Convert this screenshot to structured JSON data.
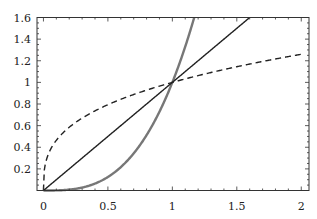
{
  "chart_data": {
    "type": "line",
    "title": "",
    "xlabel": "",
    "ylabel": "",
    "xlim": [
      -0.05,
      2.06
    ],
    "ylim": [
      0,
      1.6
    ],
    "grid": false,
    "legend": null,
    "x_ticks": [
      0,
      0.5,
      1,
      1.5,
      2
    ],
    "x_tick_labels": [
      "0",
      "0.5",
      "1",
      "1.5",
      "2"
    ],
    "y_ticks": [
      0.2,
      0.4,
      0.6,
      0.8,
      1,
      1.2,
      1.4,
      1.6
    ],
    "y_tick_labels": [
      "0.2",
      "0.4",
      "0.6",
      "0.8",
      "1",
      "1.2",
      "1.4",
      "1.6"
    ],
    "series": [
      {
        "name": "y = x^3",
        "style": "solid-thick",
        "color": "#777777",
        "x": [
          0,
          0.2,
          0.4,
          0.6,
          0.8,
          1.0,
          1.1,
          1.17
        ],
        "values": [
          0,
          0.008,
          0.064,
          0.216,
          0.512,
          1.0,
          1.331,
          1.6
        ]
      },
      {
        "name": "y = x",
        "style": "solid",
        "color": "#222222",
        "x": [
          0,
          0.5,
          1.0,
          1.6
        ],
        "values": [
          0,
          0.5,
          1.0,
          1.6
        ]
      },
      {
        "name": "y = x^(1/3)",
        "style": "dashed",
        "color": "#222222",
        "x": [
          0,
          0.01,
          0.05,
          0.1,
          0.25,
          0.5,
          1.0,
          1.5,
          2.0
        ],
        "values": [
          0,
          0.215,
          0.368,
          0.464,
          0.63,
          0.794,
          1.0,
          1.145,
          1.26
        ]
      }
    ],
    "annotations": [
      {
        "text": "curves intersect at (1,1)",
        "x": 1,
        "y": 1
      }
    ]
  }
}
